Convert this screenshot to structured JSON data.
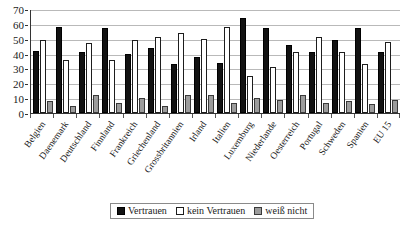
{
  "chart_data": {
    "type": "bar",
    "title": "",
    "subtitle": "",
    "xlabel": "",
    "ylabel": "",
    "ylim": [
      0,
      70
    ],
    "ytick_step": 10,
    "yticks": [
      0,
      10,
      20,
      30,
      40,
      50,
      60,
      70
    ],
    "grid": true,
    "legend_position": "bottom",
    "categories": [
      "Belgien",
      "Daenemark",
      "Deutschland",
      "Finnland",
      "Frankreich",
      "Griechenland",
      "Grossbritannien",
      "Irland",
      "Italien",
      "Luxemburg",
      "Niederlande",
      "Oesterreich",
      "Portugal",
      "Schweden",
      "Spanien",
      "EU 15"
    ],
    "series": [
      {
        "name": "Vertrauen",
        "color": "#121212",
        "values": [
          42,
          58,
          41,
          57,
          40,
          44,
          33,
          38,
          34,
          64,
          57,
          46,
          41,
          49,
          57,
          41
        ]
      },
      {
        "name": "kein Vertrauen",
        "color": "#ffffff",
        "values": [
          49,
          36,
          47,
          36,
          49,
          51,
          54,
          50,
          58,
          25,
          31,
          41,
          51,
          41,
          33,
          48
        ]
      },
      {
        "name": "weiß nicht",
        "color": "#9c9c9c",
        "values": [
          8,
          5,
          12,
          7,
          10,
          5,
          12,
          12,
          7,
          10,
          9,
          12,
          7,
          8,
          6,
          9
        ]
      }
    ]
  },
  "legend": {
    "items": [
      {
        "label": "Vertrauen",
        "swatch": "black-square-swatch"
      },
      {
        "label": "kein Vertrauen",
        "swatch": "white-square-swatch"
      },
      {
        "label": "weiß nicht",
        "swatch": "gray-square-swatch"
      }
    ]
  }
}
